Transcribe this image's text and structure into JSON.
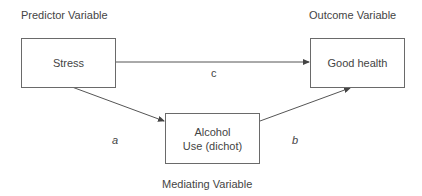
{
  "diagram": {
    "type": "mediation-model",
    "role_labels": {
      "predictor": "Predictor Variable",
      "outcome": "Outcome Variable",
      "mediator": "Mediating Variable"
    },
    "nodes": {
      "predictor": {
        "label": "Stress"
      },
      "outcome": {
        "label": "Good health"
      },
      "mediator": {
        "line1": "Alcohol",
        "line2": "Use (dichot)"
      }
    },
    "edges": [
      {
        "from": "predictor",
        "to": "outcome",
        "label": "c"
      },
      {
        "from": "predictor",
        "to": "mediator",
        "label": "a"
      },
      {
        "from": "mediator",
        "to": "outcome",
        "label": "b"
      }
    ],
    "colors": {
      "line": "#555555",
      "text": "#444444"
    }
  }
}
